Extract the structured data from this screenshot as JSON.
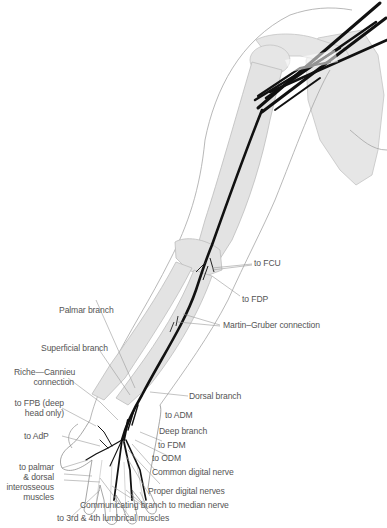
{
  "figure": {
    "colors": {
      "bone": "#e3e3e3",
      "bone_outline": "#bdbdbd",
      "skin_outline": "#9a9a9a",
      "nerve": "#111111",
      "leader": "#9a9a9a",
      "label_text": "#555555"
    }
  },
  "labels": {
    "to_fcu": "to FCU",
    "to_fdp": "to FDP",
    "martin_gruber": "Martin–Gruber connection",
    "palmar_branch": "Palmar branch",
    "superficial_branch": "Superficial branch",
    "riche_cannieu_1": "Riche—Cannieu",
    "riche_cannieu_2": "connection",
    "to_fpb_1": "to FPB (deep",
    "to_fpb_2": "head only)",
    "dorsal_branch": "Dorsal branch",
    "to_adm": "to ADM",
    "deep_branch": "Deep branch",
    "to_adp": "to AdP",
    "to_fdm": "to FDM",
    "to_odm": "to ODM",
    "common_digital": "Common digital nerve",
    "interosseous_1": "to palmar",
    "interosseous_2": "& dorsal",
    "interosseous_3": "interosseous",
    "interosseous_4": "muscles",
    "proper_digital": "Proper digital nerves",
    "communicating": "Communicating branch to median nerve",
    "lumbricals": "to 3rd & 4th lumbrical muscles"
  }
}
